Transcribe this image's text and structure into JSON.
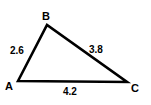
{
  "diagram": {
    "type": "triangle",
    "vertices": [
      {
        "id": "A",
        "label": "A"
      },
      {
        "id": "B",
        "label": "B"
      },
      {
        "id": "C",
        "label": "C"
      }
    ],
    "sides": [
      {
        "from": "A",
        "to": "B",
        "length": "2.6"
      },
      {
        "from": "B",
        "to": "C",
        "length": "3.8"
      },
      {
        "from": "A",
        "to": "C",
        "length": "4.2"
      }
    ],
    "stroke_color": "#000000",
    "background": "#ffffff"
  }
}
